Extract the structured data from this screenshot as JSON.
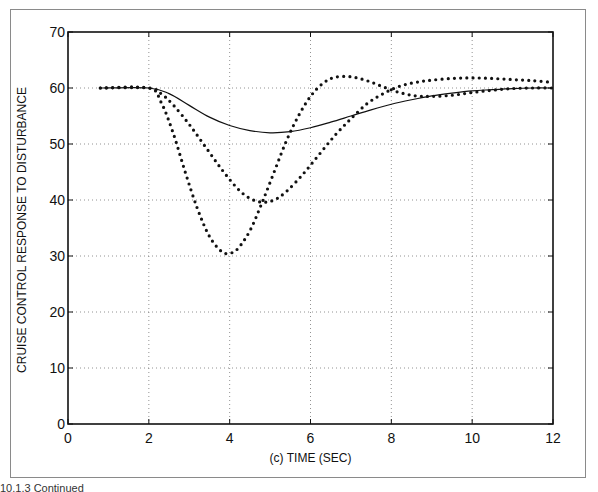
{
  "figure": {
    "caption": "10.1.3 Continued"
  },
  "chart_data": {
    "type": "line",
    "title": "",
    "xlabel": "(c)  TIME (SEC)",
    "ylabel": "CRUISE CONTROL RESPONSE TO DISTURBANCE",
    "xlim": [
      0,
      12
    ],
    "ylim": [
      0,
      70
    ],
    "xticks": [
      0,
      2,
      4,
      6,
      8,
      10,
      12
    ],
    "yticks": [
      0,
      10,
      20,
      30,
      40,
      50,
      60,
      70
    ],
    "grid": true,
    "legend": null,
    "series": [
      {
        "name": "solid response",
        "style": "solid",
        "x": [
          0.8,
          2.0,
          2.5,
          3.0,
          3.5,
          4.0,
          4.5,
          5.0,
          5.5,
          6.0,
          6.5,
          7.0,
          7.5,
          8.0,
          8.5,
          9.0,
          9.5,
          10.0,
          10.5,
          11.0,
          11.5,
          12.0
        ],
        "y": [
          60.0,
          60.0,
          59.0,
          56.9,
          54.8,
          53.3,
          52.4,
          52.0,
          52.2,
          52.9,
          53.9,
          55.0,
          56.1,
          57.1,
          57.9,
          58.6,
          59.1,
          59.5,
          59.7,
          59.9,
          60.0,
          60.0
        ]
      },
      {
        "name": "dotted response (large dip)",
        "style": "dotted",
        "x": [
          0.8,
          2.0,
          2.3,
          2.6,
          2.9,
          3.2,
          3.5,
          3.8,
          4.0,
          4.2,
          4.5,
          4.8,
          5.1,
          5.4,
          5.7,
          6.0,
          6.3,
          6.6,
          7.0,
          7.4,
          7.8,
          8.2,
          8.6,
          9.0,
          9.5,
          10.0,
          10.5,
          11.0,
          11.5,
          12.0
        ],
        "y": [
          60.0,
          60.0,
          57.5,
          52.0,
          45.0,
          38.5,
          33.5,
          30.8,
          30.5,
          31.3,
          34.5,
          39.5,
          45.0,
          50.5,
          55.0,
          58.5,
          60.8,
          61.9,
          62.0,
          61.3,
          60.2,
          59.2,
          58.6,
          58.5,
          58.7,
          59.2,
          59.6,
          59.9,
          60.0,
          60.0
        ]
      },
      {
        "name": "dotted response (moderate dip)",
        "style": "dotted",
        "x": [
          0.8,
          2.0,
          2.3,
          2.6,
          3.0,
          3.4,
          3.8,
          4.2,
          4.5,
          4.8,
          5.1,
          5.4,
          5.8,
          6.2,
          6.6,
          7.0,
          7.4,
          7.8,
          8.2,
          8.6,
          9.0,
          9.5,
          10.0,
          10.5,
          11.0,
          11.5,
          12.0
        ],
        "y": [
          60.0,
          60.0,
          59.0,
          57.0,
          53.5,
          49.5,
          45.5,
          42.0,
          40.3,
          39.6,
          40.0,
          41.5,
          44.5,
          48.0,
          51.5,
          54.5,
          57.2,
          59.0,
          60.3,
          61.0,
          61.4,
          61.7,
          61.8,
          61.7,
          61.5,
          61.3,
          61.0
        ]
      }
    ]
  }
}
